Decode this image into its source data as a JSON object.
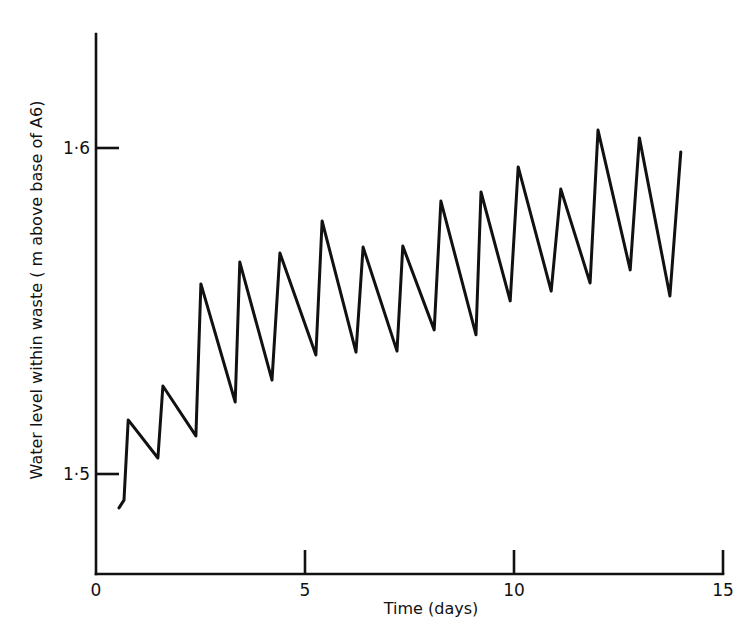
{
  "chart_data": {
    "type": "line",
    "title": "",
    "xlabel": "Time (days)",
    "ylabel": "Water level within waste (m above base of A6)",
    "xlim": [
      0,
      15
    ],
    "ylim": [
      1.469,
      1.636
    ],
    "x_ticks": [
      0,
      5,
      10,
      15
    ],
    "x_tick_labels": [
      "0",
      "5",
      "10",
      "15"
    ],
    "y_ticks": [
      1.5,
      1.6
    ],
    "y_tick_labels": [
      "1·5",
      "1·6"
    ],
    "grid": false,
    "legend": null,
    "series": [
      {
        "name": "Water level",
        "color": "#111111",
        "x": [
          0.55,
          0.67,
          0.77,
          1.48,
          1.6,
          2.39,
          2.51,
          3.33,
          3.44,
          4.21,
          4.4,
          5.26,
          5.41,
          6.22,
          6.39,
          7.2,
          7.34,
          8.09,
          8.25,
          9.09,
          9.21,
          9.91,
          10.1,
          10.89,
          11.12,
          11.82,
          12.01,
          12.78,
          13.0,
          13.73,
          13.99
        ],
        "y": [
          1.4896,
          1.492,
          1.5166,
          1.5049,
          1.527,
          1.5117,
          1.5583,
          1.5221,
          1.565,
          1.5288,
          1.5678,
          1.5365,
          1.5776,
          1.5374,
          1.5696,
          1.5377,
          1.5699,
          1.5442,
          1.5837,
          1.5427,
          1.5865,
          1.5531,
          1.5942,
          1.5561,
          1.5874,
          1.5586,
          1.6055,
          1.5626,
          1.6031,
          1.5546,
          1.5988
        ]
      }
    ],
    "annotations": []
  },
  "axes": {
    "x_title": "Time (days)",
    "y_title": "Water level within waste ( m above base of A6)",
    "x_tick_labels": [
      "0",
      "5",
      "10",
      "15"
    ],
    "y_tick_labels": [
      "1·5",
      "1·6"
    ]
  }
}
